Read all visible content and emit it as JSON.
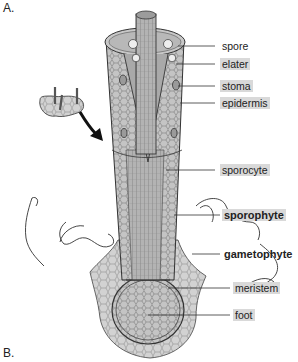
{
  "figure": {
    "panel_a_label": "A.",
    "panel_b_label": "B."
  },
  "labels": [
    {
      "text": "spore",
      "highlighted": false,
      "bold": false
    },
    {
      "text": "elater",
      "highlighted": true,
      "bold": false
    },
    {
      "text": "stoma",
      "highlighted": true,
      "bold": false
    },
    {
      "text": "epidermis",
      "highlighted": true,
      "bold": false
    },
    {
      "text": "sporocyte",
      "highlighted": true,
      "bold": false
    },
    {
      "text": "sporophyte",
      "highlighted": true,
      "bold": true
    },
    {
      "text": "gametophyte",
      "highlighted": false,
      "bold": true
    },
    {
      "text": "meristem",
      "highlighted": true,
      "bold": false
    },
    {
      "text": "foot",
      "highlighted": true,
      "bold": false
    }
  ],
  "colors": {
    "tissue_fill": "#bdbdbd",
    "tissue_dark": "#8a8a8a",
    "outline": "#333333",
    "label_highlight": "#d9d9d9"
  }
}
